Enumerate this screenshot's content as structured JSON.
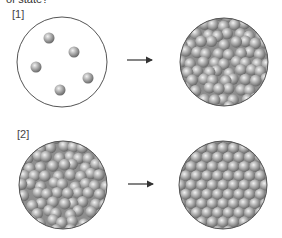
{
  "question": {
    "text": "of state?"
  },
  "colors": {
    "circle_stroke": "#555555",
    "circle_bg": "#ffffff",
    "sphere_light": "#e6e6e6",
    "sphere_mid": "#a8a8a8",
    "sphere_dark": "#6f6f6f",
    "arrow": "#333333",
    "packed_bg": "#8c8c8c"
  },
  "panels": [
    {
      "label": "[1]",
      "label_pos": [
        12,
        15
      ],
      "arrow": {
        "x1": 127,
        "x2": 155,
        "y": 60
      },
      "from": {
        "name": "gas",
        "cx": 62,
        "cy": 62,
        "r": 45,
        "arrangement": "sparse",
        "spheres": [
          [
            49,
            38
          ],
          [
            74,
            52
          ],
          [
            36,
            67
          ],
          [
            88,
            78
          ],
          [
            60,
            90
          ]
        ],
        "sphere_r": 5.5
      },
      "to": {
        "name": "liquid",
        "cx": 224,
        "cy": 62,
        "r": 44,
        "arrangement": "disordered",
        "sphere_r": 5.8
      }
    },
    {
      "label": "[2]",
      "label_pos": [
        17,
        135
      ],
      "arrow": {
        "x1": 128,
        "x2": 156,
        "y": 184
      },
      "from": {
        "name": "liquid",
        "cx": 63,
        "cy": 185,
        "r": 44,
        "arrangement": "disordered",
        "sphere_r": 5.8
      },
      "to": {
        "name": "solid",
        "cx": 223,
        "cy": 185,
        "r": 44,
        "arrangement": "hexagonal",
        "sphere_r": 5.6
      }
    }
  ]
}
